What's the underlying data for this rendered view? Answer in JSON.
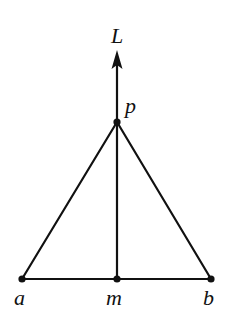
{
  "diagram": {
    "type": "geometry",
    "colors": {
      "background": "#ffffff",
      "ink": "#111111"
    },
    "points": {
      "a": {
        "label": "a",
        "x": 22,
        "y": 279
      },
      "m": {
        "label": "m",
        "x": 117,
        "y": 279
      },
      "b": {
        "label": "b",
        "x": 211,
        "y": 279
      },
      "p": {
        "label": "p",
        "x": 117,
        "y": 122
      }
    },
    "line_L": {
      "label": "L",
      "from": {
        "x": 117,
        "y": 279
      },
      "to": {
        "x": 117,
        "y": 50
      },
      "arrow": "up"
    },
    "segments": [
      {
        "from": "a",
        "to": "b"
      },
      {
        "from": "a",
        "to": "p"
      },
      {
        "from": "b",
        "to": "p"
      },
      {
        "from": "m",
        "to": "p"
      }
    ],
    "labels": {
      "L": "L",
      "p": "p",
      "a": "a",
      "m": "m",
      "b": "b"
    }
  }
}
